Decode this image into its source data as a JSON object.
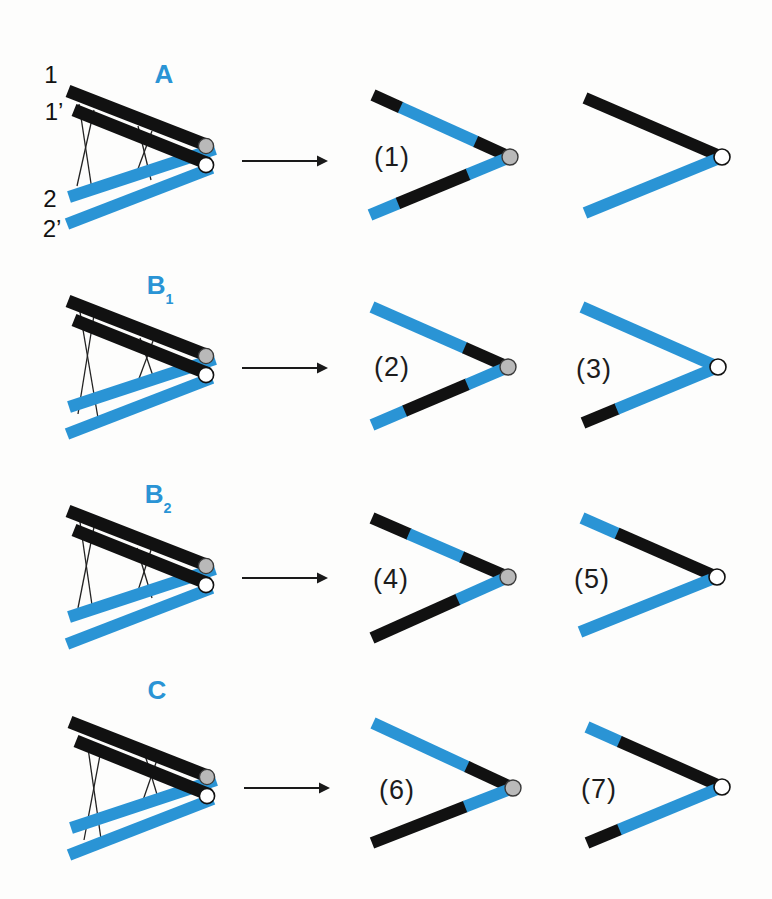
{
  "figure": {
    "type": "meiosis-crossover-diagram",
    "background": "#fdfdfc"
  },
  "colors": {
    "blue": "#2a94d5",
    "black": "#111111",
    "gray_centromere_fill": "#b9b9b9",
    "gray_centromere_stroke": "#3a3a3a",
    "white_centromere_fill": "#ffffff",
    "white_centromere_stroke": "#111111",
    "crossover_line": "#222222",
    "arrow": "#1a1a1a"
  },
  "chromatid_labels": [
    {
      "id": "1",
      "text": "1",
      "x": 51,
      "y": 75
    },
    {
      "id": "1-prime",
      "text": "1’",
      "x": 54,
      "y": 112
    },
    {
      "id": "2",
      "text": "2",
      "x": 50,
      "y": 199
    },
    {
      "id": "2-prime",
      "text": "2’",
      "x": 52,
      "y": 229
    }
  ],
  "rows": [
    {
      "id": "a",
      "label": {
        "main": "A",
        "sub": "",
        "x": 164,
        "y": 76
      },
      "arrow": {
        "x1": 242,
        "x2": 318,
        "tip": 328,
        "y": 161
      },
      "bivalent": {
        "crossovers": [
          [
            79,
            104,
            92,
            190
          ],
          [
            94,
            110,
            77,
            186
          ],
          [
            138,
            126,
            151,
            180
          ],
          [
            152,
            131,
            135,
            177
          ]
        ],
        "blue_bars": [
          [
            69,
            197,
            215,
            149
          ],
          [
            67,
            224,
            212,
            168
          ]
        ],
        "black_bars": [
          [
            68,
            91,
            209,
            146
          ],
          [
            74,
            110,
            209,
            164
          ]
        ],
        "gray_circle": [
          206,
          146
        ],
        "white_circle": [
          206,
          165
        ]
      },
      "results": [
        {
          "label": "(1)",
          "label_x": 392,
          "label_y": 157,
          "vertex": [
            510,
            157
          ],
          "vertex_fill": "gray",
          "upper": {
            "tip": [
              373,
              95
            ],
            "segments": [
              [
                "black",
                0.2
              ],
              [
                "blue",
                0.55
              ],
              [
                "black",
                0.25
              ]
            ]
          },
          "lower": {
            "tip": [
              370,
              215
            ],
            "segments": [
              [
                "blue",
                0.2
              ],
              [
                "black",
                0.5
              ],
              [
                "blue",
                0.3
              ]
            ]
          }
        },
        {
          "label": "",
          "label_x": 0,
          "label_y": 0,
          "vertex": [
            722,
            157
          ],
          "vertex_fill": "white",
          "upper": {
            "tip": [
              585,
              98
            ],
            "segments": [
              [
                "black",
                1
              ]
            ]
          },
          "lower": {
            "tip": [
              585,
              213
            ],
            "segments": [
              [
                "blue",
                1
              ]
            ]
          }
        }
      ]
    },
    {
      "id": "b1",
      "label": {
        "main": "B",
        "sub": "1",
        "x": 160,
        "y": 287
      },
      "arrow": {
        "x1": 242,
        "x2": 318,
        "tip": 328,
        "y": 368
      },
      "bivalent": {
        "crossovers": [
          [
            80,
            312,
            98,
            418
          ],
          [
            94,
            315,
            78,
            414
          ],
          [
            140,
            338,
            155,
            382
          ],
          [
            153,
            341,
            137,
            384
          ]
        ],
        "blue_bars": [
          [
            69,
            407,
            215,
            359
          ],
          [
            67,
            434,
            212,
            378
          ]
        ],
        "black_bars": [
          [
            68,
            301,
            209,
            356
          ],
          [
            74,
            320,
            209,
            374
          ]
        ],
        "gray_circle": [
          206,
          356
        ],
        "white_circle": [
          206,
          375
        ]
      },
      "results": [
        {
          "label": "(2)",
          "label_x": 392,
          "label_y": 367,
          "vertex": [
            508,
            367
          ],
          "vertex_fill": "gray",
          "upper": {
            "tip": [
              372,
              307
            ],
            "segments": [
              [
                "blue",
                0.68
              ],
              [
                "black",
                0.32
              ]
            ]
          },
          "lower": {
            "tip": [
              372,
              425
            ],
            "segments": [
              [
                "blue",
                0.24
              ],
              [
                "black",
                0.46
              ],
              [
                "blue",
                0.3
              ]
            ]
          }
        },
        {
          "label": "(3)",
          "label_x": 594,
          "label_y": 369,
          "vertex": [
            718,
            367
          ],
          "vertex_fill": "white",
          "upper": {
            "tip": [
              582,
              307
            ],
            "segments": [
              [
                "blue",
                1
              ]
            ]
          },
          "lower": {
            "tip": [
              583,
              423
            ],
            "segments": [
              [
                "black",
                0.25
              ],
              [
                "blue",
                0.75
              ]
            ]
          }
        }
      ]
    },
    {
      "id": "b2",
      "label": {
        "main": "B",
        "sub": "2",
        "x": 158,
        "y": 496
      },
      "arrow": {
        "x1": 242,
        "x2": 318,
        "tip": 328,
        "y": 578
      },
      "bivalent": {
        "crossovers": [
          [
            80,
            522,
            93,
            612
          ],
          [
            94,
            527,
            78,
            608
          ],
          [
            137,
            548,
            152,
            598
          ],
          [
            151,
            550,
            136,
            597
          ]
        ],
        "blue_bars": [
          [
            69,
            617,
            215,
            569
          ],
          [
            67,
            644,
            212,
            588
          ]
        ],
        "black_bars": [
          [
            68,
            511,
            209,
            566
          ],
          [
            74,
            530,
            209,
            584
          ]
        ],
        "gray_circle": [
          206,
          566
        ],
        "white_circle": [
          206,
          585
        ]
      },
      "results": [
        {
          "label": "(4)",
          "label_x": 391,
          "label_y": 579,
          "vertex": [
            508,
            577
          ],
          "vertex_fill": "gray",
          "upper": {
            "tip": [
              372,
              518
            ],
            "segments": [
              [
                "black",
                0.27
              ],
              [
                "blue",
                0.39
              ],
              [
                "black",
                0.34
              ]
            ]
          },
          "lower": {
            "tip": [
              372,
              638
            ],
            "segments": [
              [
                "black",
                0.63
              ],
              [
                "blue",
                0.37
              ]
            ]
          }
        },
        {
          "label": "(5)",
          "label_x": 592,
          "label_y": 579,
          "vertex": [
            717,
            577
          ],
          "vertex_fill": "white",
          "upper": {
            "tip": [
              582,
              518
            ],
            "segments": [
              [
                "blue",
                0.26
              ],
              [
                "black",
                0.74
              ]
            ]
          },
          "lower": {
            "tip": [
              580,
              632
            ],
            "segments": [
              [
                "blue",
                1
              ]
            ]
          }
        }
      ]
    },
    {
      "id": "c",
      "label": {
        "main": "C",
        "sub": "",
        "x": 157,
        "y": 692
      },
      "arrow": {
        "x1": 244,
        "x2": 320,
        "tip": 330,
        "y": 788
      },
      "bivalent": {
        "crossovers": [
          [
            88,
            748,
            102,
            846
          ],
          [
            101,
            750,
            84,
            840
          ],
          [
            145,
            755,
            159,
            801
          ],
          [
            158,
            757,
            141,
            806
          ]
        ],
        "blue_bars": [
          [
            71,
            828,
            216,
            780
          ],
          [
            69,
            855,
            213,
            799
          ]
        ],
        "black_bars": [
          [
            70,
            722,
            210,
            777
          ],
          [
            76,
            741,
            210,
            795
          ]
        ],
        "gray_circle": [
          207,
          777
        ],
        "white_circle": [
          207,
          796
        ]
      },
      "results": [
        {
          "label": "(6)",
          "label_x": 397,
          "label_y": 790,
          "vertex": [
            513,
            788
          ],
          "vertex_fill": "gray",
          "upper": {
            "tip": [
              373,
              723
            ],
            "segments": [
              [
                "blue",
                0.67
              ],
              [
                "black",
                0.33
              ]
            ]
          },
          "lower": {
            "tip": [
              372,
              843
            ],
            "segments": [
              [
                "black",
                0.66
              ],
              [
                "blue",
                0.34
              ]
            ]
          }
        },
        {
          "label": "(7)",
          "label_x": 599,
          "label_y": 789,
          "vertex": [
            722,
            787
          ],
          "vertex_fill": "white",
          "upper": {
            "tip": [
              587,
              727
            ],
            "segments": [
              [
                "blue",
                0.24
              ],
              [
                "black",
                0.76
              ]
            ]
          },
          "lower": {
            "tip": [
              587,
              843
            ],
            "segments": [
              [
                "black",
                0.24
              ],
              [
                "blue",
                0.76
              ]
            ]
          }
        }
      ]
    }
  ]
}
